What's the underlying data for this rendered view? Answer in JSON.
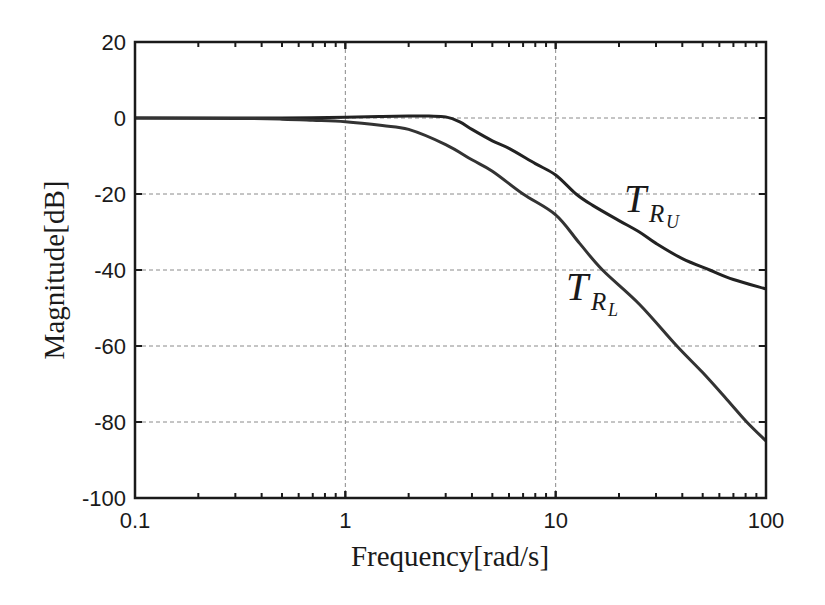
{
  "chart_data": {
    "type": "line",
    "title": "",
    "xlabel": "Frequency[rad/s]",
    "ylabel": "Magnitude[dB]",
    "xscale": "log",
    "xlim": [
      0.1,
      100
    ],
    "ylim": [
      -100,
      20
    ],
    "grid": true,
    "x_ticks": [
      0.1,
      1,
      10,
      100
    ],
    "x_tick_labels": [
      "0.1",
      "1",
      "10",
      "100"
    ],
    "y_ticks": [
      20,
      0,
      -20,
      -40,
      -60,
      -80,
      -100
    ],
    "y_tick_labels": [
      "20",
      "0",
      "-20",
      "-40",
      "-60",
      "-80",
      "-100"
    ],
    "series": [
      {
        "name": "T_RU",
        "label_main": "T",
        "label_sub": "R",
        "label_subsub": "U",
        "color": "#222222",
        "x": [
          0.1,
          0.3,
          0.5,
          1,
          1.5,
          2,
          2.5,
          3,
          3.5,
          4,
          5,
          6,
          8,
          10,
          12.5,
          15,
          20,
          25,
          30,
          40,
          54,
          70,
          100
        ],
        "y": [
          0,
          0,
          0,
          0.2,
          0.4,
          0.5,
          0.5,
          0.3,
          -1,
          -3,
          -6,
          -8,
          -12,
          -15,
          -20,
          -23,
          -27,
          -30,
          -33,
          -37,
          -40,
          -42.5,
          -45
        ]
      },
      {
        "name": "T_RL",
        "label_main": "T",
        "label_sub": "R",
        "label_subsub": "L",
        "color": "#333333",
        "x": [
          0.1,
          0.3,
          0.5,
          0.7,
          1,
          1.5,
          2,
          3,
          4,
          5,
          7,
          10,
          13,
          16.7,
          25,
          37.7,
          50,
          65,
          81,
          100
        ],
        "y": [
          0,
          -0.1,
          -0.3,
          -0.6,
          -1,
          -2,
          -3,
          -7,
          -11,
          -14,
          -20,
          -25.5,
          -33,
          -40,
          -49,
          -60,
          -67,
          -74,
          -80,
          -85
        ]
      }
    ],
    "annotations": [
      {
        "text": "T_RU",
        "x": 22,
        "y": -22
      },
      {
        "text": "T_RL",
        "x": 8,
        "y": -45
      }
    ]
  }
}
